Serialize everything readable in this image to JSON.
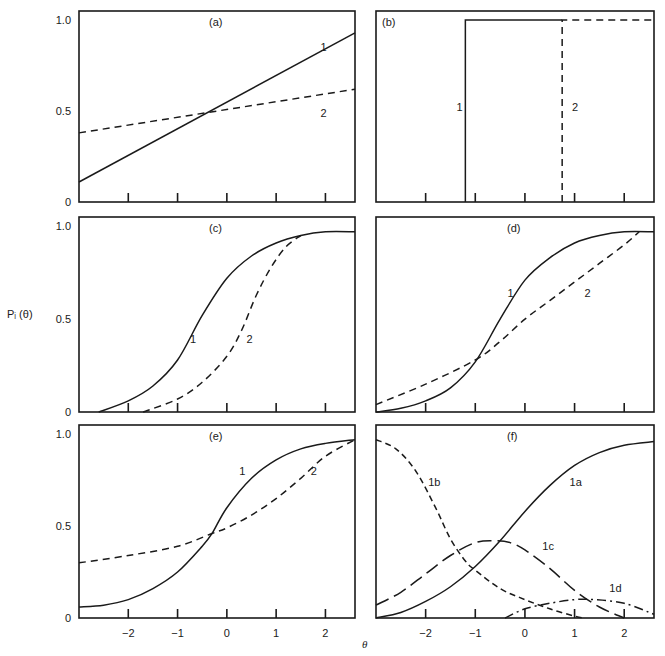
{
  "figure": {
    "y_axis_label": "Pᵢ (θ)",
    "x_axis_label": "θ"
  },
  "chart_data": [
    {
      "panel": "(a)",
      "type": "line",
      "xlabel": "θ",
      "ylabel": "Pᵢ(θ)",
      "xlim": [
        -3.0,
        2.6
      ],
      "ylim": [
        0,
        1.05
      ],
      "xticks": [
        -2,
        -1,
        0,
        1,
        2
      ],
      "yticks": [
        0,
        0.5,
        1.0
      ],
      "ytick_labels": [
        "0",
        "0.5",
        "1.0"
      ],
      "show_xtick_labels": false,
      "show_ytick_labels": true,
      "grid": false,
      "series": [
        {
          "name": "1",
          "style": "solid",
          "label_pos": [
            1.9,
            0.83
          ],
          "x": [
            -3.0,
            2.6
          ],
          "y": [
            0.11,
            0.93
          ]
        },
        {
          "name": "2",
          "style": "dashed",
          "label_pos": [
            1.9,
            0.47
          ],
          "x": [
            -3.0,
            2.6
          ],
          "y": [
            0.38,
            0.62
          ]
        }
      ]
    },
    {
      "panel": "(b)",
      "type": "line",
      "xlabel": "θ",
      "ylabel": "Pᵢ(θ)",
      "xlim": [
        -3.0,
        2.6
      ],
      "ylim": [
        0,
        1.05
      ],
      "xticks": [
        -2,
        -1,
        0,
        1,
        2
      ],
      "yticks": [],
      "show_xtick_labels": false,
      "show_ytick_labels": false,
      "grid": false,
      "series": [
        {
          "name": "1",
          "style": "solid",
          "label_pos": [
            -1.38,
            0.5
          ],
          "x": [
            -1.2,
            -1.2,
            0.75
          ],
          "y": [
            0,
            1.0,
            1.0
          ]
        },
        {
          "name": "2",
          "style": "dashed",
          "label_pos": [
            0.95,
            0.5
          ],
          "x": [
            0.75,
            0.75,
            2.6
          ],
          "y": [
            0,
            1.0,
            1.0
          ]
        }
      ]
    },
    {
      "panel": "(c)",
      "type": "line",
      "xlabel": "θ",
      "ylabel": "Pᵢ(θ)",
      "xlim": [
        -3.0,
        2.6
      ],
      "ylim": [
        0,
        1.05
      ],
      "xticks": [
        -2,
        -1,
        0,
        1,
        2
      ],
      "yticks": [
        0,
        0.5,
        1.0
      ],
      "ytick_labels": [
        "0",
        "0.5",
        "1.0"
      ],
      "show_xtick_labels": false,
      "show_ytick_labels": true,
      "grid": false,
      "series": [
        {
          "name": "1",
          "style": "solid",
          "label_pos": [
            -0.75,
            0.37
          ],
          "x": [
            -2.6,
            -2.0,
            -1.5,
            -1.0,
            -0.5,
            0.0,
            0.5,
            1.0,
            1.5,
            2.0,
            2.6
          ],
          "y": [
            0.0,
            0.06,
            0.14,
            0.28,
            0.52,
            0.72,
            0.84,
            0.91,
            0.95,
            0.97,
            0.97
          ]
        },
        {
          "name": "2",
          "style": "dashed",
          "label_pos": [
            0.4,
            0.37
          ],
          "x": [
            -1.7,
            -1.0,
            -0.5,
            0.0,
            0.3,
            0.6,
            0.9,
            1.2,
            1.5
          ],
          "y": [
            0.0,
            0.07,
            0.16,
            0.3,
            0.44,
            0.63,
            0.78,
            0.89,
            0.95
          ]
        }
      ]
    },
    {
      "panel": "(d)",
      "type": "line",
      "xlabel": "θ",
      "ylabel": "Pᵢ(θ)",
      "xlim": [
        -3.0,
        2.6
      ],
      "ylim": [
        0,
        1.05
      ],
      "xticks": [
        -2,
        -1,
        0,
        1,
        2
      ],
      "yticks": [],
      "show_xtick_labels": false,
      "show_ytick_labels": false,
      "grid": false,
      "series": [
        {
          "name": "1",
          "style": "solid",
          "label_pos": [
            -0.35,
            0.62
          ],
          "x": [
            -3.0,
            -2.5,
            -2.0,
            -1.5,
            -1.0,
            -0.5,
            0.0,
            0.5,
            1.0,
            1.5,
            2.0,
            2.6
          ],
          "y": [
            0.0,
            0.02,
            0.06,
            0.13,
            0.27,
            0.5,
            0.71,
            0.83,
            0.91,
            0.95,
            0.97,
            0.97
          ]
        },
        {
          "name": "2",
          "style": "dashed",
          "label_pos": [
            1.2,
            0.62
          ],
          "x": [
            -3.0,
            -2.0,
            -1.0,
            -0.5,
            0.0,
            0.5,
            1.0,
            1.5,
            2.0,
            2.3
          ],
          "y": [
            0.04,
            0.15,
            0.28,
            0.38,
            0.5,
            0.6,
            0.7,
            0.8,
            0.9,
            0.97
          ]
        }
      ]
    },
    {
      "panel": "(e)",
      "type": "line",
      "xlabel": "θ",
      "ylabel": "Pᵢ(θ)",
      "xlim": [
        -3.0,
        2.6
      ],
      "ylim": [
        0,
        1.05
      ],
      "xticks": [
        -2,
        -1,
        0,
        1,
        2
      ],
      "xtick_labels": [
        "−2",
        "−1",
        "0",
        "1",
        "2"
      ],
      "yticks": [
        0,
        0.5,
        1.0
      ],
      "ytick_labels": [
        "0",
        "0.5",
        "1.0"
      ],
      "show_xtick_labels": true,
      "show_ytick_labels": true,
      "grid": false,
      "series": [
        {
          "name": "1",
          "style": "solid",
          "label_pos": [
            0.25,
            0.78
          ],
          "x": [
            -3.0,
            -2.5,
            -2.0,
            -1.5,
            -1.0,
            -0.5,
            -0.3,
            0.0,
            0.5,
            1.0,
            1.5,
            2.0,
            2.6
          ],
          "y": [
            0.06,
            0.07,
            0.1,
            0.16,
            0.25,
            0.39,
            0.46,
            0.6,
            0.76,
            0.86,
            0.92,
            0.95,
            0.97
          ]
        },
        {
          "name": "2",
          "style": "dashed",
          "label_pos": [
            1.7,
            0.78
          ],
          "x": [
            -3.0,
            -2.0,
            -1.0,
            -0.3,
            0.0,
            0.5,
            1.0,
            1.5,
            2.0,
            2.6
          ],
          "y": [
            0.3,
            0.34,
            0.39,
            0.46,
            0.49,
            0.56,
            0.65,
            0.76,
            0.88,
            0.97
          ]
        }
      ]
    },
    {
      "panel": "(f)",
      "type": "line",
      "xlabel": "θ",
      "ylabel": "Pᵢ(θ)",
      "xlim": [
        -3.0,
        2.6
      ],
      "ylim": [
        0,
        1.05
      ],
      "xticks": [
        -2,
        -1,
        0,
        1,
        2
      ],
      "xtick_labels": [
        "−2",
        "−1",
        "0",
        "1",
        "2"
      ],
      "yticks": [],
      "show_xtick_labels": true,
      "show_ytick_labels": false,
      "grid": false,
      "series": [
        {
          "name": "1a",
          "style": "solid",
          "label_pos": [
            0.9,
            0.72
          ],
          "x": [
            -3.0,
            -2.5,
            -2.0,
            -1.5,
            -1.0,
            -0.5,
            0.0,
            0.5,
            1.0,
            1.5,
            2.0,
            2.6
          ],
          "y": [
            0.0,
            0.03,
            0.09,
            0.17,
            0.28,
            0.42,
            0.58,
            0.72,
            0.83,
            0.9,
            0.94,
            0.96
          ]
        },
        {
          "name": "1b",
          "style": "short-dash",
          "label_pos": [
            -1.95,
            0.72
          ],
          "x": [
            -3.0,
            -2.6,
            -2.2,
            -1.8,
            -1.5,
            -1.2,
            -1.0,
            -0.5,
            0.0,
            0.5,
            1.0,
            1.2
          ],
          "y": [
            0.97,
            0.92,
            0.8,
            0.6,
            0.43,
            0.31,
            0.26,
            0.16,
            0.1,
            0.05,
            0.01,
            0.0
          ]
        },
        {
          "name": "1c",
          "style": "long-dash",
          "label_pos": [
            0.35,
            0.37
          ],
          "x": [
            -3.0,
            -2.5,
            -2.0,
            -1.5,
            -1.0,
            -0.6,
            -0.3,
            0.0,
            0.5,
            1.0,
            1.5,
            2.0
          ],
          "y": [
            0.07,
            0.14,
            0.24,
            0.34,
            0.41,
            0.42,
            0.41,
            0.37,
            0.27,
            0.15,
            0.06,
            0.0
          ]
        },
        {
          "name": "1d",
          "style": "dash-dot",
          "label_pos": [
            1.7,
            0.14
          ],
          "x": [
            -0.4,
            0.0,
            0.5,
            1.0,
            1.4,
            2.0,
            2.6
          ],
          "y": [
            0.0,
            0.05,
            0.08,
            0.1,
            0.1,
            0.08,
            0.02
          ]
        }
      ]
    }
  ]
}
